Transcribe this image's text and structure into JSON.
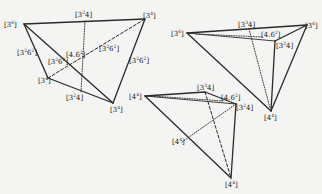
{
  "figures": [
    {
      "id": "left",
      "vertices": [
        {
          "key": "A",
          "label": "3",
          "sup": "6"
        },
        {
          "key": "B",
          "label": "3",
          "sup": "4"
        },
        {
          "key": "C",
          "label": "3",
          "sup": "4"
        },
        {
          "key": "D",
          "label": "3",
          "sup": "4"
        }
      ],
      "edge_labels": [
        {
          "label": "3",
          "sup": "2",
          "tail": "4"
        },
        {
          "label": "3",
          "sup": "2",
          "tail": "4"
        },
        {
          "label": "3",
          "sup": "2",
          "tail": "6",
          "tailsup": "2"
        },
        {
          "label": "3",
          "sup": "2",
          "tail": "6",
          "tailsup": "2"
        },
        {
          "label": "4.6",
          "sup": "2"
        },
        {
          "label": "3",
          "sup": "2",
          "tail": "6",
          "tailsup": "2"
        },
        {
          "label": "3",
          "sup": "2",
          "tail": "6",
          "tailsup": "2"
        }
      ]
    },
    {
      "id": "upper-right",
      "vertices": [
        {
          "key": "A",
          "label": "3",
          "sup": "6"
        },
        {
          "key": "B",
          "label": "3",
          "sup": "6"
        },
        {
          "key": "C",
          "label": "4",
          "sup": "4"
        }
      ],
      "edge_labels": [
        {
          "label": "3",
          "sup": "3",
          "tail": "4"
        },
        {
          "label": "4.6",
          "sup": "2"
        },
        {
          "label": "3",
          "sup": "2",
          "tail": "4"
        }
      ]
    },
    {
      "id": "lower-middle",
      "vertices": [
        {
          "key": "A",
          "label": "4",
          "sup": "4"
        },
        {
          "key": "B",
          "label": "4",
          "sup": "4"
        },
        {
          "key": "C",
          "label": "4",
          "sup": "4"
        }
      ],
      "edge_labels": [
        {
          "label": "3",
          "sup": "3",
          "tail": "4"
        },
        {
          "label": "4.6",
          "sup": "2"
        },
        {
          "label": "3",
          "sup": "2",
          "tail": "4"
        }
      ]
    }
  ]
}
